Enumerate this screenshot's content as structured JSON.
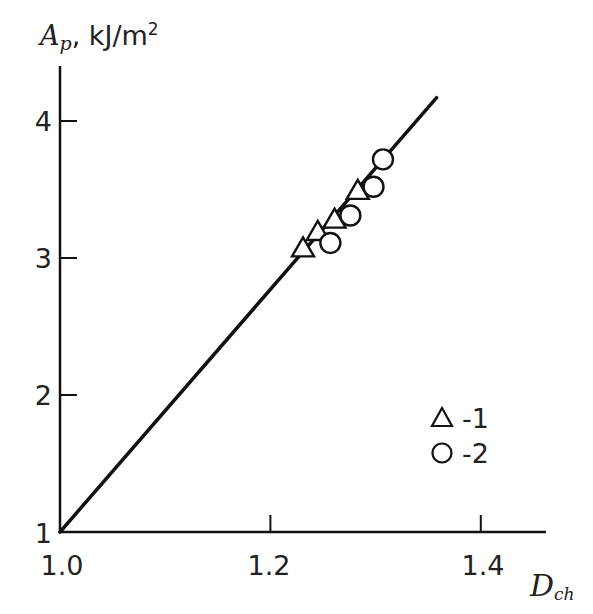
{
  "chart_data": {
    "type": "scatter",
    "title": "",
    "xlabel": "D_ch",
    "xlabel_main": "D",
    "xlabel_sub": "ch",
    "ylabel": "A_p, kJ/m2",
    "ylabel_main": "A",
    "ylabel_sub": "p",
    "ylabel_unit": ", kJ/m",
    "ylabel_sup": "2",
    "xlim": [
      1.0,
      1.45
    ],
    "ylim": [
      1.0,
      4.35
    ],
    "x_ticks": [
      1.2,
      1.4
    ],
    "x_tick_labels": [
      "1.0",
      "1.2",
      "1.4"
    ],
    "y_ticks": [
      2,
      3,
      4
    ],
    "y_tick_labels": [
      "1",
      "2",
      "3",
      "4"
    ],
    "grid": false,
    "legend_position": "inside-lower-right",
    "series": [
      {
        "name": "1",
        "legend_label": "-1",
        "marker": "triangle-open",
        "x": [
          1.231,
          1.245,
          1.261,
          1.283
        ],
        "y": [
          3.07,
          3.19,
          3.28,
          3.49
        ]
      },
      {
        "name": "2",
        "legend_label": "-2",
        "marker": "circle-open",
        "x": [
          1.257,
          1.276,
          1.298,
          1.307
        ],
        "y": [
          3.11,
          3.31,
          3.52,
          3.72
        ]
      },
      {
        "name": "fit line",
        "type": "line",
        "x": [
          1.0,
          1.358
        ],
        "y": [
          1.0,
          4.17
        ]
      }
    ]
  },
  "colors": {
    "ink": "#111111",
    "background": "#ffffff"
  }
}
